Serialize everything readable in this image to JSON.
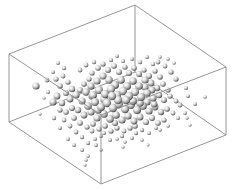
{
  "chart_data": {
    "type": "scatter3d",
    "title": "",
    "xlabel": "",
    "ylabel": "",
    "zlabel": "",
    "grid": false,
    "legend": null,
    "box": {
      "edge_color": "#8a8a8a",
      "corners": {
        "top_left": [
          9,
          54
        ],
        "top_back": [
          135,
          5
        ],
        "top_right": [
          226,
          67
        ],
        "top_front": [
          101,
          115
        ],
        "bottom_left": [
          9,
          122
        ],
        "bottom_back": [
          135,
          72
        ],
        "bottom_right": [
          226,
          135
        ],
        "bottom_front": [
          101,
          184
        ]
      },
      "edges": [
        [
          "top_left",
          "top_back"
        ],
        [
          "top_back",
          "top_right"
        ],
        [
          "top_right",
          "top_front"
        ],
        [
          "top_front",
          "top_left"
        ],
        [
          "bottom_left",
          "bottom_back"
        ],
        [
          "bottom_back",
          "bottom_right"
        ],
        [
          "bottom_right",
          "bottom_front"
        ],
        [
          "bottom_front",
          "bottom_left"
        ],
        [
          "top_left",
          "bottom_left"
        ],
        [
          "top_back",
          "bottom_back"
        ],
        [
          "top_right",
          "bottom_right"
        ],
        [
          "top_front",
          "bottom_front"
        ]
      ]
    },
    "marker": {
      "shape": "sphere",
      "fill": "#d8d8d8",
      "highlight": "#ffffff",
      "shadow": "#2a2a2a"
    },
    "points_screen": [
      [
        36,
        86,
        3.6
      ],
      [
        47,
        80,
        2.4
      ],
      [
        53,
        72,
        2.0
      ],
      [
        56,
        79,
        2.6
      ],
      [
        63,
        76,
        2.4
      ],
      [
        60,
        86,
        2.8
      ],
      [
        68,
        82,
        2.6
      ],
      [
        72,
        89,
        3.2
      ],
      [
        66,
        93,
        3.0
      ],
      [
        57,
        96,
        3.4
      ],
      [
        53,
        102,
        3.6
      ],
      [
        62,
        103,
        3.2
      ],
      [
        70,
        99,
        3.4
      ],
      [
        76,
        95,
        3.6
      ],
      [
        80,
        90,
        3.0
      ],
      [
        84,
        84,
        2.8
      ],
      [
        89,
        79,
        2.6
      ],
      [
        92,
        73,
        2.6
      ],
      [
        98,
        68,
        2.8
      ],
      [
        103,
        64,
        2.6
      ],
      [
        108,
        70,
        3.0
      ],
      [
        114,
        66,
        2.8
      ],
      [
        119,
        72,
        3.0
      ],
      [
        125,
        67,
        2.6
      ],
      [
        129,
        73,
        3.0
      ],
      [
        134,
        68,
        2.8
      ],
      [
        139,
        74,
        3.0
      ],
      [
        144,
        70,
        2.6
      ],
      [
        149,
        76,
        3.0
      ],
      [
        155,
        71,
        2.6
      ],
      [
        160,
        77,
        2.8
      ],
      [
        158,
        62,
        2.4
      ],
      [
        165,
        66,
        2.4
      ],
      [
        171,
        72,
        2.6
      ],
      [
        176,
        79,
        2.6
      ],
      [
        163,
        84,
        2.8
      ],
      [
        168,
        90,
        2.6
      ],
      [
        157,
        88,
        3.2
      ],
      [
        151,
        83,
        3.4
      ],
      [
        145,
        80,
        3.6
      ],
      [
        139,
        86,
        3.8
      ],
      [
        133,
        81,
        3.8
      ],
      [
        127,
        86,
        4.0
      ],
      [
        121,
        80,
        3.8
      ],
      [
        115,
        85,
        4.0
      ],
      [
        109,
        80,
        3.8
      ],
      [
        103,
        76,
        3.6
      ],
      [
        97,
        81,
        3.6
      ],
      [
        91,
        86,
        3.6
      ],
      [
        86,
        92,
        3.8
      ],
      [
        93,
        95,
        4.0
      ],
      [
        99,
        90,
        4.0
      ],
      [
        105,
        94,
        4.2
      ],
      [
        111,
        89,
        4.2
      ],
      [
        117,
        95,
        4.2
      ],
      [
        123,
        91,
        4.2
      ],
      [
        129,
        96,
        4.2
      ],
      [
        135,
        92,
        4.0
      ],
      [
        141,
        97,
        4.0
      ],
      [
        147,
        93,
        3.8
      ],
      [
        153,
        98,
        3.6
      ],
      [
        159,
        95,
        3.2
      ],
      [
        164,
        100,
        3.0
      ],
      [
        170,
        96,
        2.6
      ],
      [
        176,
        101,
        2.4
      ],
      [
        82,
        101,
        3.6
      ],
      [
        88,
        106,
        3.8
      ],
      [
        95,
        102,
        4.0
      ],
      [
        101,
        107,
        4.0
      ],
      [
        107,
        103,
        4.2
      ],
      [
        113,
        108,
        4.2
      ],
      [
        119,
        104,
        4.2
      ],
      [
        125,
        109,
        4.2
      ],
      [
        131,
        105,
        4.0
      ],
      [
        137,
        110,
        4.0
      ],
      [
        143,
        106,
        3.8
      ],
      [
        149,
        111,
        3.6
      ],
      [
        155,
        107,
        3.4
      ],
      [
        161,
        112,
        3.2
      ],
      [
        167,
        109,
        2.8
      ],
      [
        173,
        113,
        2.4
      ],
      [
        78,
        110,
        3.2
      ],
      [
        84,
        115,
        3.4
      ],
      [
        91,
        112,
        3.6
      ],
      [
        97,
        118,
        3.6
      ],
      [
        104,
        114,
        3.8
      ],
      [
        110,
        119,
        3.8
      ],
      [
        116,
        115,
        3.8
      ],
      [
        122,
        120,
        3.6
      ],
      [
        128,
        116,
        3.6
      ],
      [
        134,
        121,
        3.4
      ],
      [
        140,
        117,
        3.4
      ],
      [
        146,
        122,
        3.0
      ],
      [
        152,
        118,
        3.0
      ],
      [
        158,
        123,
        2.8
      ],
      [
        164,
        120,
        2.6
      ],
      [
        72,
        108,
        3.0
      ],
      [
        66,
        112,
        2.8
      ],
      [
        60,
        110,
        2.6
      ],
      [
        74,
        118,
        2.8
      ],
      [
        80,
        123,
        2.8
      ],
      [
        87,
        127,
        2.6
      ],
      [
        93,
        124,
        2.8
      ],
      [
        99,
        129,
        2.6
      ],
      [
        105,
        126,
        2.8
      ],
      [
        111,
        131,
        2.6
      ],
      [
        117,
        128,
        2.6
      ],
      [
        124,
        131,
        2.4
      ],
      [
        130,
        128,
        2.6
      ],
      [
        136,
        133,
        2.2
      ],
      [
        142,
        130,
        2.2
      ],
      [
        149,
        133,
        2.0
      ],
      [
        70,
        126,
        2.4
      ],
      [
        76,
        132,
        2.4
      ],
      [
        82,
        137,
        2.2
      ],
      [
        68,
        139,
        2.0
      ],
      [
        74,
        145,
        2.0
      ],
      [
        82,
        150,
        2.0
      ],
      [
        88,
        143,
        2.2
      ],
      [
        95,
        139,
        2.0
      ],
      [
        101,
        136,
        2.0
      ],
      [
        88,
        156,
        1.8
      ],
      [
        86,
        160,
        1.8
      ],
      [
        85,
        165,
        1.6
      ],
      [
        101,
        150,
        1.8
      ],
      [
        104,
        133,
        2.0
      ],
      [
        110,
        140,
        2.0
      ],
      [
        117,
        139,
        1.8
      ],
      [
        125,
        142,
        1.8
      ],
      [
        123,
        147,
        1.6
      ],
      [
        148,
        145,
        1.4
      ],
      [
        160,
        130,
        1.8
      ],
      [
        168,
        126,
        1.8
      ],
      [
        178,
        118,
        2.0
      ],
      [
        185,
        113,
        2.0
      ],
      [
        195,
        104,
        2.0
      ],
      [
        188,
        96,
        2.0
      ],
      [
        205,
        97,
        1.8
      ],
      [
        187,
        118,
        1.8
      ],
      [
        190,
        125,
        1.6
      ],
      [
        180,
        105,
        2.4
      ],
      [
        186,
        88,
        2.0
      ],
      [
        58,
        63,
        2.0
      ],
      [
        64,
        68,
        2.2
      ],
      [
        48,
        92,
        2.0
      ],
      [
        44,
        98,
        1.6
      ],
      [
        40,
        114,
        1.6
      ],
      [
        86,
        65,
        2.4
      ],
      [
        94,
        62,
        2.2
      ],
      [
        80,
        70,
        2.4
      ],
      [
        111,
        60,
        2.2
      ],
      [
        117,
        56,
        2.0
      ],
      [
        123,
        61,
        2.0
      ],
      [
        132,
        59,
        2.0
      ],
      [
        140,
        62,
        2.2
      ],
      [
        147,
        57,
        2.0
      ],
      [
        153,
        64,
        2.2
      ],
      [
        160,
        57,
        1.8
      ],
      [
        168,
        59,
        1.8
      ],
      [
        174,
        63,
        1.8
      ],
      [
        60,
        128,
        2.0
      ],
      [
        54,
        118,
        2.2
      ],
      [
        64,
        120,
        2.4
      ],
      [
        122,
        136,
        2.2
      ],
      [
        156,
        128,
        2.0
      ],
      [
        142,
        140,
        1.8
      ],
      [
        132,
        138,
        2.0
      ],
      [
        96,
        145,
        2.0
      ],
      [
        92,
        131,
        2.4
      ],
      [
        115,
        123,
        3.0
      ],
      [
        135,
        126,
        2.8
      ],
      [
        152,
        90,
        3.4
      ],
      [
        145,
        87,
        3.6
      ],
      [
        118,
        100,
        4.2
      ],
      [
        112,
        96,
        4.2
      ],
      [
        126,
        100,
        4.2
      ],
      [
        133,
        101,
        4.0
      ],
      [
        104,
        99,
        4.0
      ],
      [
        98,
        110,
        3.8
      ],
      [
        92,
        96,
        3.8
      ],
      [
        140,
        103,
        3.8
      ],
      [
        147,
        102,
        3.6
      ],
      [
        154,
        104,
        3.4
      ]
    ]
  }
}
